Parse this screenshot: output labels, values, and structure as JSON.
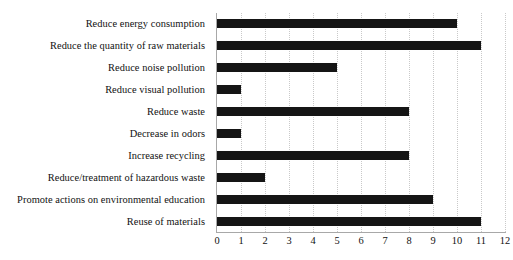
{
  "chart_data": {
    "type": "bar",
    "orientation": "horizontal",
    "title": "",
    "subtitle": "",
    "xlabel": "",
    "ylabel": "",
    "xlim": [
      0,
      12
    ],
    "xticks": [
      0,
      1,
      2,
      3,
      4,
      5,
      6,
      7,
      8,
      9,
      10,
      11,
      12
    ],
    "xtick_labels": [
      "0",
      "1",
      "2",
      "3",
      "4",
      "5",
      "6",
      "7",
      "8",
      "9",
      "10",
      "11",
      "12"
    ],
    "grid": "vertical-dotted",
    "legend": "none",
    "bar_color": "#151515",
    "axis_color": "#a8a8a8",
    "grid_color": "#c9c9c9",
    "categories": [
      "Reduce energy consumption",
      "Reduce the quantity of raw materials",
      "Reduce noise pollution",
      "Reduce visual pollution",
      "Reduce waste",
      "Decrease in odors",
      "Increase recycling",
      "Reduce/treatment of hazardous waste",
      "Promote actions on environmental education",
      "Reuse of materials"
    ],
    "values": [
      10,
      11,
      5,
      1,
      8,
      1,
      8,
      2,
      9,
      11
    ],
    "series": [
      {
        "name": "",
        "values": [
          10,
          11,
          5,
          1,
          8,
          1,
          8,
          2,
          9,
          11
        ]
      }
    ]
  }
}
